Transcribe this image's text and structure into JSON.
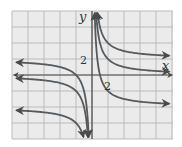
{
  "chart_data": {
    "type": "line",
    "title": "",
    "xlabel": "x",
    "ylabel": "y",
    "xlim": [
      -10,
      10
    ],
    "ylim": [
      -8,
      8
    ],
    "grid": true,
    "grid_step": 2,
    "tick_labels": {
      "x": "2",
      "y": "2"
    },
    "x_tick_label_value": 2,
    "y_tick_label_value": 2,
    "series": [
      {
        "name": "y = 4/x + 2",
        "k": 4,
        "c": 2
      },
      {
        "name": "y = 4/x",
        "k": 4,
        "c": 0
      },
      {
        "name": "y = 4/x - 4",
        "k": 4,
        "c": -4
      }
    ],
    "colors": {
      "curve": "#555a5e",
      "grid_background": "#ebebeb",
      "grid_line": "#b5b5b5",
      "axis": "#4a4a4a"
    }
  },
  "labels": {
    "x_axis": "x",
    "y_axis": "y",
    "x_tick": "2",
    "y_tick": "2"
  }
}
